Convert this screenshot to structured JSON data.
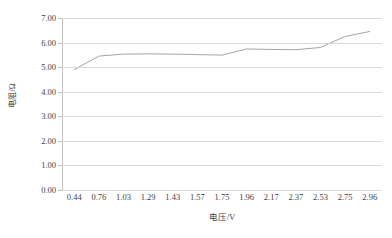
{
  "chart_data": {
    "type": "line",
    "title": "",
    "xlabel": "电压/V",
    "ylabel": "电阻/Ω",
    "categories": [
      "0.44",
      "0.76",
      "1.03",
      "1.29",
      "1.43",
      "1.57",
      "1.75",
      "1.96",
      "2.17",
      "2.37",
      "2.53",
      "2.75",
      "2.96"
    ],
    "values": [
      4.9,
      5.45,
      5.53,
      5.54,
      5.53,
      5.51,
      5.49,
      5.74,
      5.72,
      5.71,
      5.8,
      6.25,
      6.45
    ],
    "ylim": [
      0.0,
      7.0
    ],
    "ytick_step": 1.0,
    "yticks": [
      "0.00",
      "1.00",
      "2.00",
      "3.00",
      "4.00",
      "5.00",
      "6.00",
      "7.00"
    ],
    "grid": true,
    "grid_axis": "y",
    "legend": false,
    "legend_position": "none",
    "series": [
      {
        "name": "电阻",
        "color": "#a5a5a5",
        "values": [
          4.9,
          5.45,
          5.53,
          5.54,
          5.53,
          5.51,
          5.49,
          5.74,
          5.72,
          5.71,
          5.8,
          6.25,
          6.45
        ]
      }
    ],
    "colors": {
      "line": "#a5a5a5",
      "grid": "#d9d9d9",
      "axis": "#bfbfbf",
      "text": "#3f3f3f",
      "background": "#ffffff"
    }
  }
}
